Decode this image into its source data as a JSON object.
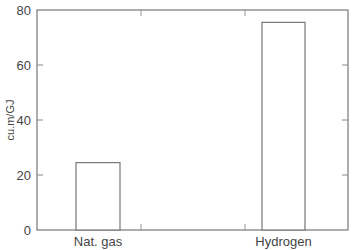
{
  "chart_data": {
    "type": "bar",
    "title": "",
    "xlabel": "",
    "ylabel": "cu.m/GJ",
    "categories": [
      "Nat. gas",
      "Hydrogen"
    ],
    "values": [
      24.5,
      75.5
    ],
    "ylim": [
      0,
      80
    ],
    "yticks": [
      0,
      20,
      40,
      60,
      80
    ],
    "grid": false,
    "legend": null,
    "bar_style": {
      "fill": "#ffffff",
      "stroke": "#777777"
    }
  },
  "labels": {
    "ylabel": "cu.m/GJ",
    "yticks": [
      "0",
      "20",
      "40",
      "60",
      "80"
    ],
    "categories": [
      "Nat. gas",
      "Hydrogen"
    ]
  }
}
